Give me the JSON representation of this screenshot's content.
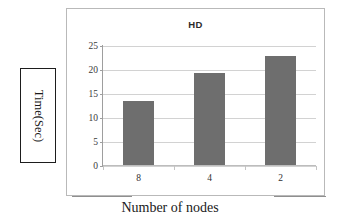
{
  "chart_data": {
    "type": "bar",
    "title": "HD",
    "xlabel": "Number of nodes",
    "ylabel": "Time(Sec)",
    "categories": [
      "8",
      "4",
      "2"
    ],
    "values": [
      13.3,
      19.2,
      22.7
    ],
    "series": [
      {
        "name": "HD",
        "values": [
          13.3,
          19.2,
          22.7
        ]
      }
    ],
    "ylim": [
      0,
      25
    ],
    "yticks": [
      "0",
      "5",
      "10",
      "15",
      "20",
      "25"
    ],
    "ytick_values": [
      0,
      5,
      10,
      15,
      20,
      25
    ],
    "grid": true,
    "legend": false,
    "bar_color": "#6e6e6e",
    "gridline_color": "#d2d2d2",
    "frame_color": "#b9b9b9"
  },
  "axis_label_box": {
    "text": "Time(Sec)"
  }
}
